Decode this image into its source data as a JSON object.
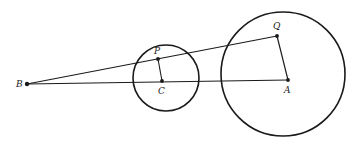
{
  "figure": {
    "width": 359,
    "height": 146,
    "stroke_color": "#1a1a1a",
    "background": "#ffffff"
  },
  "points": {
    "B": {
      "label": "B",
      "x": 27,
      "y": 84,
      "label_x": 16,
      "label_y": 87
    },
    "C": {
      "label": "C",
      "x": 162,
      "y": 81,
      "label_x": 158,
      "label_y": 94
    },
    "P": {
      "label": "P",
      "x": 158,
      "y": 59,
      "label_x": 154,
      "label_y": 54
    },
    "A": {
      "label": "A",
      "x": 288,
      "y": 80,
      "label_x": 284,
      "label_y": 93
    },
    "Q": {
      "label": "Q",
      "x": 277,
      "y": 36,
      "label_x": 273,
      "label_y": 29
    }
  },
  "circles": [
    {
      "name": "small-circle",
      "cx": 166,
      "cy": 78,
      "r": 33
    },
    {
      "name": "large-circle",
      "cx": 283,
      "cy": 74,
      "r": 62
    }
  ],
  "segments": [
    {
      "name": "segment-BA",
      "from": "B",
      "to": "A"
    },
    {
      "name": "segment-BQ",
      "from": "B",
      "to": "Q"
    },
    {
      "name": "segment-CP",
      "from": "C",
      "to": "P"
    },
    {
      "name": "segment-AQ",
      "from": "A",
      "to": "Q"
    }
  ]
}
